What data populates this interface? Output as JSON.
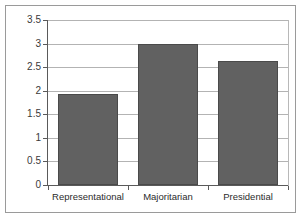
{
  "chart_data": {
    "type": "bar",
    "title": "",
    "xlabel": "",
    "ylabel": "",
    "categories": [
      "Representational",
      "Majoritarian",
      "Presidential"
    ],
    "values": [
      1.93,
      3.0,
      2.62
    ],
    "ylim": [
      0,
      3.5
    ],
    "ytick_labels": [
      "0",
      "0.5",
      "1",
      "1.5",
      "2",
      "2.5",
      "3",
      "3.5"
    ],
    "ytick_values": [
      0,
      0.5,
      1,
      1.5,
      2,
      2.5,
      3,
      3.5
    ],
    "grid": "horizontal",
    "legend": "none",
    "bar_color": "#616161",
    "grid_color": "#b3b3b3",
    "axis_color": "#5a5a5a",
    "background_color": "#ffffff",
    "frame_color": "#9a9a9a"
  }
}
